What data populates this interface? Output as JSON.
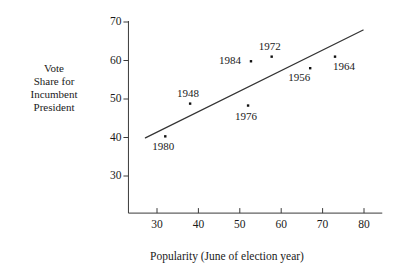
{
  "chart_data": {
    "type": "scatter",
    "title": "",
    "xlabel": "Popularity (June of election year)",
    "ylabel": "Vote Share for Incumbent President",
    "ylabel_lines": [
      "Vote",
      "Share for",
      "Incumbent",
      "President"
    ],
    "xlim": [
      26,
      82
    ],
    "ylim": [
      24,
      72
    ],
    "xticks": [
      30,
      40,
      50,
      60,
      70,
      80
    ],
    "yticks": [
      30,
      40,
      50,
      60,
      70
    ],
    "xtick_labels": [
      "30",
      "40",
      "50",
      "60",
      "70",
      "80"
    ],
    "ytick_labels": [
      "30",
      "40",
      "50",
      "60",
      "70"
    ],
    "grid": false,
    "legend": false,
    "points": [
      {
        "label": "1980",
        "x": 32.0,
        "y": 40.3,
        "label_pos": "below"
      },
      {
        "label": "1948",
        "x": 38.0,
        "y": 48.8,
        "label_pos": "above"
      },
      {
        "label": "1976",
        "x": 52.0,
        "y": 48.3,
        "label_pos": "below"
      },
      {
        "label": "1984",
        "x": 52.7,
        "y": 59.8,
        "label_pos": "left"
      },
      {
        "label": "1972",
        "x": 57.7,
        "y": 61.0,
        "label_pos": "above"
      },
      {
        "label": "1956",
        "x": 67.0,
        "y": 58.0,
        "label_pos": "below-left"
      },
      {
        "label": "1964",
        "x": 73.0,
        "y": 61.0,
        "label_pos": "below-right"
      }
    ],
    "fit_line": {
      "name": "regression line",
      "x_start": 27.2,
      "y_start": 39.9,
      "x_end": 79.8,
      "y_end": 67.9
    },
    "colors": {
      "axis": "#3a3a3a",
      "point": "#111111",
      "line": "#333333",
      "text": "#1a1a1a",
      "background": "#ffffff"
    }
  }
}
